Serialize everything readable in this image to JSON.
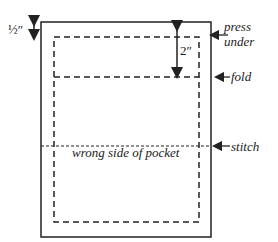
{
  "labels": {
    "half_inch": "½″",
    "two_inch": "2″",
    "press_under_1": "press",
    "press_under_2": "under",
    "fold": "fold",
    "stitch": "stitch",
    "center": "wrong side of pocket"
  },
  "colors": {
    "line": "#222222",
    "background": "#ffffff"
  }
}
